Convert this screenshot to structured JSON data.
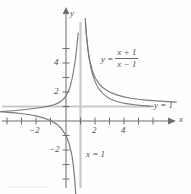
{
  "chart_data": {
    "type": "line",
    "title": "",
    "xlabel": "x",
    "ylabel": "y",
    "xlim": [
      -4.6,
      8.2
    ],
    "ylim": [
      -5.0,
      5.6
    ],
    "grid": false,
    "legend_position": "none",
    "function": "y = (x + 1) / (x - 1)",
    "equation_parts": {
      "lhs": "y =",
      "numerator": "x + 1",
      "denominator": "x − 1"
    },
    "asymptotes": [
      {
        "name": "vertical-asymptote",
        "equation": "x = 1",
        "type": "vertical",
        "value": 1
      },
      {
        "name": "horizontal-asymptote",
        "equation": "y = 1",
        "type": "horizontal",
        "value": 1
      }
    ],
    "x_ticks": [
      -4,
      -3,
      -2,
      -1,
      1,
      2,
      3,
      4,
      5,
      6,
      7
    ],
    "x_tick_labels": [
      {
        "value": -2,
        "label": "−2"
      },
      {
        "value": 2,
        "label": "2"
      },
      {
        "value": 4,
        "label": "4"
      }
    ],
    "y_ticks": [
      -4,
      -3,
      -2,
      -1,
      1,
      2,
      3,
      4,
      5
    ],
    "y_tick_labels": [
      {
        "value": 4,
        "label": "4"
      },
      {
        "value": 2,
        "label": "2"
      },
      {
        "value": -2,
        "label": "−2"
      }
    ],
    "series": [
      {
        "name": "left-branch",
        "x": [
          -4.6,
          -4.0,
          -3.5,
          -3.0,
          -2.5,
          -2.0,
          -1.5,
          -1.0,
          -0.6,
          -0.3,
          0.0,
          0.2,
          0.4,
          0.5,
          0.6,
          0.65,
          0.7
        ],
        "y": [
          0.643,
          0.6,
          0.556,
          0.5,
          0.429,
          0.333,
          0.2,
          0.0,
          -0.25,
          -0.538,
          -1.0,
          -1.5,
          -2.333,
          -3.0,
          -4.0,
          -4.714,
          -5.667
        ]
      },
      {
        "name": "right-branch",
        "x": [
          1.33,
          1.4,
          1.5,
          1.6,
          1.8,
          2.0,
          2.25,
          2.5,
          3.0,
          3.5,
          4.0,
          4.5,
          5.0,
          5.5,
          6.0,
          6.5,
          7.0,
          7.6
        ],
        "y": [
          7.06,
          6.0,
          5.0,
          4.33,
          3.5,
          3.0,
          2.6,
          2.33,
          2.0,
          1.8,
          1.667,
          1.571,
          1.5,
          1.444,
          1.4,
          1.364,
          1.333,
          1.303
        ]
      }
    ]
  },
  "labels": {
    "x_axis": "x",
    "y_axis": "y",
    "tick_x_neg2": "−2",
    "tick_x_2": "2",
    "tick_x_4": "4",
    "tick_y_4": "4",
    "tick_y_2": "2",
    "tick_y_neg2": "−2",
    "horizontal_asymptote": "y = 1",
    "vertical_asymptote": "x = 1",
    "equation_lhs": "y =",
    "equation_numerator": "x + 1",
    "equation_denominator": "x − 1"
  },
  "colors": {
    "curve": "#7b7b7b",
    "axis": "#6e6e6e",
    "asymptote": "#c9c9c9",
    "text": "#4f4f4f",
    "background": "#fefefe"
  }
}
